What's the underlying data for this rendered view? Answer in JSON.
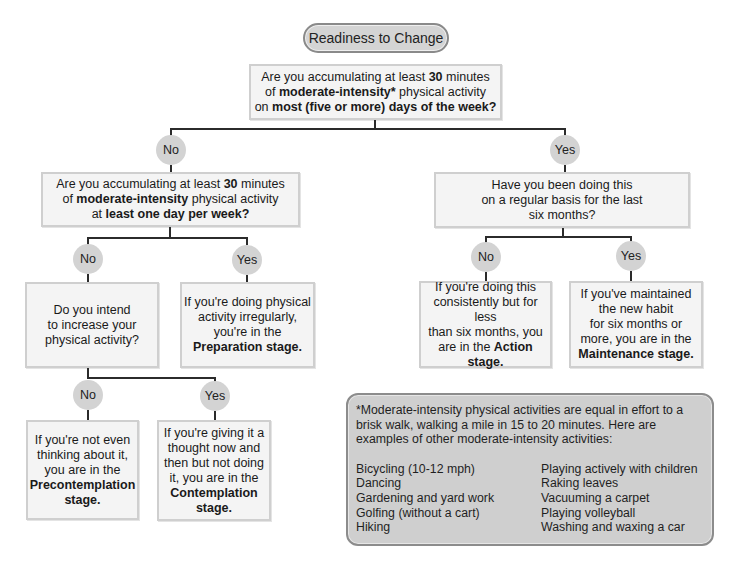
{
  "title": "Readiness to Change",
  "q1": {
    "parts": [
      "Are you accumulating at least ",
      "30",
      " minutes",
      "of ",
      "moderate-intensity*",
      " physical activity",
      "on ",
      "most (five or more) days of the week?"
    ]
  },
  "labels": {
    "no": "No",
    "yes": "Yes"
  },
  "q2_left": {
    "parts": [
      "Are you accumulating at least ",
      "30",
      " minutes",
      "of ",
      "moderate-intensity",
      " physical activity",
      "at ",
      "least one day per week?"
    ]
  },
  "q2_right": {
    "lines": [
      "Have you been doing this",
      "on a regular basis for the last",
      "six months?"
    ]
  },
  "q3_left": {
    "lines": [
      "Do you intend",
      "to increase your",
      "physical activity?"
    ]
  },
  "preparation": {
    "lines": [
      "If you're doing physical",
      "activity irregularly,",
      "you're in the"
    ],
    "stage": "Preparation stage."
  },
  "action": {
    "lines": [
      "If you're doing this",
      "consistently but for less",
      "than six months, you",
      "are in the "
    ],
    "stage": "Action stage."
  },
  "maintenance": {
    "lines": [
      "If you've maintained",
      "the new habit",
      "for six months or",
      "more, you are in the"
    ],
    "stage": "Maintenance stage."
  },
  "precontemplation": {
    "lines": [
      "If you're not even",
      "thinking about it,",
      "you are in the"
    ],
    "stage": [
      "Precontemplation",
      "stage."
    ]
  },
  "contemplation": {
    "lines": [
      "If you're giving it a",
      "thought now and",
      "then but not doing",
      "it, you are in the"
    ],
    "stage": [
      "Contemplation",
      "stage."
    ]
  },
  "note": {
    "intro": "*Moderate-intensity physical activities are equal in effort to a brisk walk, walking a mile in 15 to 20 minutes.  Here are examples of other moderate-intensity activities:",
    "col1": [
      "Bicycling (10-12 mph)",
      "Dancing",
      "Gardening and yard work",
      "Golfing (without a cart)",
      "Hiking"
    ],
    "col2": [
      "Playing actively with children",
      "Raking leaves",
      "Vacuuming a carpet",
      "Playing volleyball",
      "Washing and waxing a car"
    ]
  },
  "colors": {
    "box_fill": "#f4f4f4",
    "box_border": "#cfcfcf",
    "circle_fill": "#d3d3d3",
    "note_fill": "#cfcfcf",
    "pill_fill": "#d4d4d4",
    "line": "#2b2b2b"
  }
}
